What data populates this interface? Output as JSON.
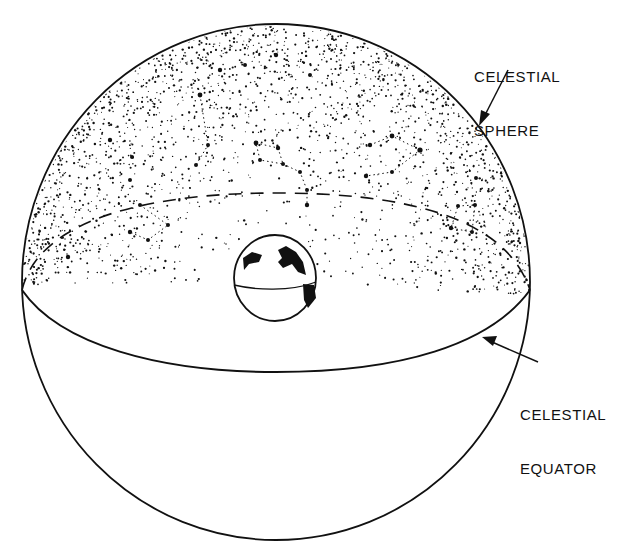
{
  "figure": {
    "type": "celestial-sphere-illustration",
    "colors": {
      "ink": "#111111",
      "background": "#ffffff"
    }
  },
  "labels": {
    "celestial_sphere": {
      "line1": "CELESTIAL",
      "line2": "SPHERE"
    },
    "celestial_equator": {
      "line1": "CELESTIAL",
      "line2": "EQUATOR"
    }
  },
  "elements": {
    "sphere": "celestial-sphere-outline",
    "equator_front": "celestial-equator-solid-front-arc",
    "equator_back": "celestial-equator-dashed-back-arc",
    "earth": "earth-globe-center",
    "stars": "stippled-star-field-with-constellations"
  }
}
